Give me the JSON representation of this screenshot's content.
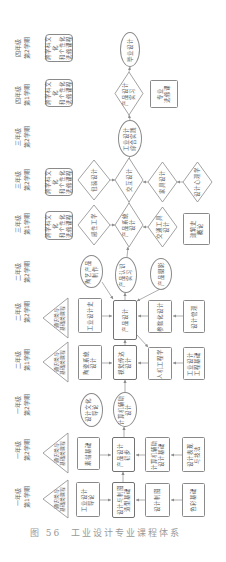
{
  "figure": {
    "caption_number": "图 56",
    "caption_title": "工业设计专业课程体系"
  },
  "semesters": [
    {
      "year": "四年级",
      "term": "第2学期"
    },
    {
      "year": "四年级",
      "term": "第1学期"
    },
    {
      "year": "三年级",
      "term": "第2学期"
    },
    {
      "year": "三年级",
      "term": "第2学期"
    },
    {
      "year": "三年级",
      "term": "第1学期"
    },
    {
      "year": "二年级",
      "term": "第2学期"
    },
    {
      "year": "二年级",
      "term": "第2学期"
    },
    {
      "year": "二年级",
      "term": "第1学期"
    },
    {
      "year": "一年级",
      "term": "第2学期"
    },
    {
      "year": "一年级",
      "term": "第2学期"
    },
    {
      "year": "一年级",
      "term": "第1学期"
    }
  ],
  "nodes": {
    "a1": {
      "label": "跨学科文化\n和个性化\n选修课程",
      "shape": "rounded-rect"
    },
    "a2": {
      "label": "跨学科文化\n和个性化\n选修课程",
      "shape": "rounded-rect"
    },
    "a3": {
      "label": "跨学科文化\n和个性化\n选修课程",
      "shape": "rounded-rect"
    },
    "a4": {
      "label": "跨学科文化\n和个性化\n选修课程",
      "shape": "rounded-rect"
    },
    "a5": {
      "label": "通识类与\n基础类课程",
      "shape": "triangle"
    },
    "a6": {
      "label": "通识类与\n基础类课程",
      "shape": "triangle"
    },
    "a7": {
      "label": "通识类与\n基础类课程",
      "shape": "triangle"
    },
    "a8": {
      "label": "通识类与\n基础类课程",
      "shape": "triangle"
    },
    "b1": {
      "label": "包装设计",
      "shape": "diamond"
    },
    "b2": {
      "label": "感性工学",
      "shape": "diamond"
    },
    "b3": {
      "label": "陶艺产品\n制作",
      "shape": "ellipse"
    },
    "b4": {
      "label": "工业设计史",
      "shape": "rect"
    },
    "b5": {
      "label": "陶瓷系统\n设计",
      "shape": "rect"
    },
    "b6": {
      "label": "设计文化\n导论",
      "shape": "ellipse"
    },
    "b7": {
      "label": "素描基础",
      "shape": "rect"
    },
    "b8": {
      "label": "工业设计\n导论",
      "shape": "rect"
    },
    "c1": {
      "label": "毕业设计",
      "shape": "ellipse"
    },
    "c2": {
      "label": "产品设计\n实习",
      "shape": "diamond"
    },
    "c3": {
      "label": "工业设计\n综合实践",
      "shape": "ellipse"
    },
    "c4": {
      "label": "交互设计",
      "shape": "diamond"
    },
    "c5": {
      "label": "产品系统\n设计",
      "shape": "diamond"
    },
    "c6": {
      "label": "产品认识\n实习",
      "shape": "ellipse"
    },
    "c7": {
      "label": "产品设计",
      "shape": "bold-rect"
    },
    "c8": {
      "label": "视觉传达\n设计",
      "shape": "bold-rect"
    },
    "c9": {
      "label": "计算机辅助\n设计",
      "shape": "ellipse"
    },
    "c10": {
      "label": "产品设计\n初步",
      "shape": "bold-rect"
    },
    "c11": {
      "label": "设计与制图\n造型基础",
      "shape": "bold-rect"
    },
    "d1": {
      "label": "专业\n选修课",
      "shape": "rect"
    },
    "d2": {
      "label": "家具设计",
      "shape": "diamond"
    },
    "d3": {
      "label": "交通工具\n设计",
      "shape": "diamond"
    },
    "d4": {
      "label": "产品摄影",
      "shape": "ellipse"
    },
    "d5": {
      "label": "参数化设计",
      "shape": "rect"
    },
    "d6": {
      "label": "人机工程学",
      "shape": "rect"
    },
    "d7": {
      "label": "计算机辅助\n设计基础",
      "shape": "rect"
    },
    "d8": {
      "label": "设计制图",
      "shape": "rect"
    },
    "e1": {
      "label": "设计心理学",
      "shape": "diamond"
    },
    "e2": {
      "label": "建筑史\n概论",
      "shape": "rect"
    },
    "e3": {
      "label": "设计管理",
      "shape": "rect"
    },
    "e4": {
      "label": "工业设计\n工程基础",
      "shape": "rect"
    },
    "e5": {
      "label": "设计表现\n与技法",
      "shape": "rect"
    },
    "e6": {
      "label": "色彩基础",
      "shape": "rect"
    }
  }
}
